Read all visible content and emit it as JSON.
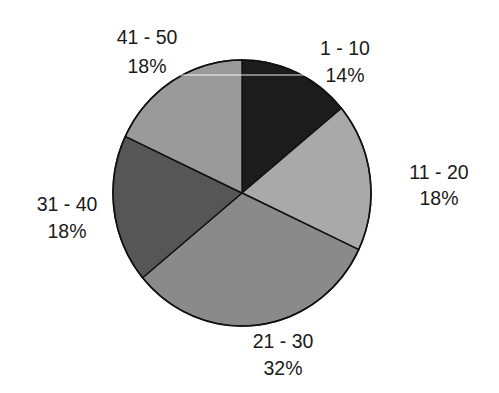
{
  "chart_data": {
    "type": "pie",
    "title": "",
    "start_angle_deg": 0,
    "direction": "clockwise",
    "categories": [
      "1 - 10",
      "11 - 20",
      "21 - 30",
      "31 - 40",
      "41 - 50"
    ],
    "values": [
      14,
      18,
      32,
      18,
      18
    ],
    "value_labels": [
      "14%",
      "18%",
      "32%",
      "18%",
      "18%"
    ],
    "colors": [
      "#1c1c1c",
      "#a9a9a9",
      "#8a8a8a",
      "#565656",
      "#9a9a9a"
    ],
    "legend": "none",
    "slices": [
      {
        "label": "1 - 10",
        "percent": 14,
        "percent_label": "14%",
        "color": "#1c1c1c",
        "label_x": 345,
        "label_y1": 55,
        "label_y2": 82
      },
      {
        "label": "11 - 20",
        "percent": 18,
        "percent_label": "18%",
        "color": "#a9a9a9",
        "label_x": 439,
        "label_y1": 179,
        "label_y2": 205
      },
      {
        "label": "21 - 30",
        "percent": 32,
        "percent_label": "32%",
        "color": "#8a8a8a",
        "label_x": 283,
        "label_y1": 348,
        "label_y2": 375
      },
      {
        "label": "31 - 40",
        "percent": 18,
        "percent_label": "18%",
        "color": "#565656",
        "label_x": 67,
        "label_y1": 211,
        "label_y2": 238
      },
      {
        "label": "41 - 50",
        "percent": 18,
        "percent_label": "18%",
        "color": "#9a9a9a",
        "label_x": 147,
        "label_y1": 44,
        "label_y2": 73
      }
    ]
  },
  "layout": {
    "center_x": 242,
    "center_y": 193,
    "radius_x": 129,
    "radius_y": 133
  }
}
